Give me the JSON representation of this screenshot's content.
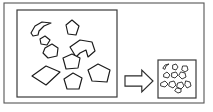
{
  "figure": {
    "background_color": "#ffffff",
    "line_color": "#1a1a1a",
    "frame_color": "#555555"
  },
  "outer_frame": {
    "name": "outer-frame",
    "x": 4,
    "y": 3,
    "width": 200,
    "height": 100
  },
  "feed_panel": {
    "name": "feed-panel",
    "label": "",
    "x": 17,
    "y": 10,
    "width": 100,
    "height": 87,
    "particle_count": 9,
    "particles": [
      {
        "name": "crescent-particle",
        "shape": "concave-crescent",
        "points": "31,33 35,26 42,22 51,23 44,26 39,31 38,35 33,36"
      },
      {
        "name": "diamond-particle-upper",
        "shape": "quadrilateral",
        "points": "66,25 72,20 79,26 76,35 68,34"
      },
      {
        "name": "rounded-particle-left",
        "shape": "pentagon",
        "points": "45,48 52,44 58,48 57,56 48,58 43,53"
      },
      {
        "name": "arrow-particle-concave",
        "shape": "concave-polygon",
        "points": "70,47 80,40 92,42 95,51 88,57 86,50 80,53 76,57"
      },
      {
        "name": "pentagon-particle-center",
        "shape": "pentagon",
        "points": "63,58 72,54 80,58 78,68 66,69"
      },
      {
        "name": "large-rhombus-particle",
        "shape": "quadrilateral",
        "points": "32,76 46,66 60,72 46,85"
      },
      {
        "name": "pentagon-particle-bottom",
        "shape": "pentagon",
        "points": "64,79 73,73 82,78 79,89 67,89"
      },
      {
        "name": "pentagon-particle-right",
        "shape": "pentagon",
        "points": "88,70 98,64 110,70 107,82 92,81"
      },
      {
        "name": "small-particle-upper-left",
        "shape": "quadrilateral",
        "points": "40,39 45,36 50,40 47,45 41,44"
      }
    ]
  },
  "arrow": {
    "name": "process-arrow",
    "direction": "right",
    "label": "",
    "x": 125,
    "y": 70,
    "width": 28,
    "height": 22
  },
  "product_panel": {
    "name": "product-panel",
    "label": "",
    "x": 158,
    "y": 60,
    "width": 38,
    "height": 38,
    "particle_count": 11,
    "particles": [
      {
        "name": "small-crescent-particle",
        "shape": "concave-crescent",
        "points": "163,68 165,65 169,64 166,66 165,69"
      },
      {
        "name": "small-particle-1",
        "shape": "ellipse",
        "points": "173,65 176,64 178,67 176,70 173,69"
      },
      {
        "name": "small-particle-2",
        "shape": "ellipse",
        "points": "164,74 167,72 170,75 168,78 164,77"
      },
      {
        "name": "small-particle-3",
        "shape": "ellipse",
        "points": "172,73 176,72 178,75 175,78 172,77"
      },
      {
        "name": "small-particle-4",
        "shape": "ellipse",
        "points": "181,72 185,73 186,77 182,79 179,76"
      },
      {
        "name": "small-particle-5",
        "shape": "ellipse",
        "points": "161,83 165,81 168,84 165,87 161,86"
      },
      {
        "name": "small-particle-6",
        "shape": "ellipse",
        "points": "170,82 174,81 176,85 173,88 169,86"
      },
      {
        "name": "small-particle-7",
        "shape": "ellipse",
        "points": "178,83 182,82 184,86 181,89 177,87"
      },
      {
        "name": "small-particle-8",
        "shape": "ellipse",
        "points": "186,81 190,82 191,86 187,88 185,85"
      },
      {
        "name": "small-particle-9",
        "shape": "ellipse",
        "points": "183,66 187,66 188,70 185,72 182,70"
      },
      {
        "name": "small-particle-10",
        "shape": "ellipse",
        "points": "177,88 181,89 181,92 178,93 175,91"
      }
    ]
  }
}
